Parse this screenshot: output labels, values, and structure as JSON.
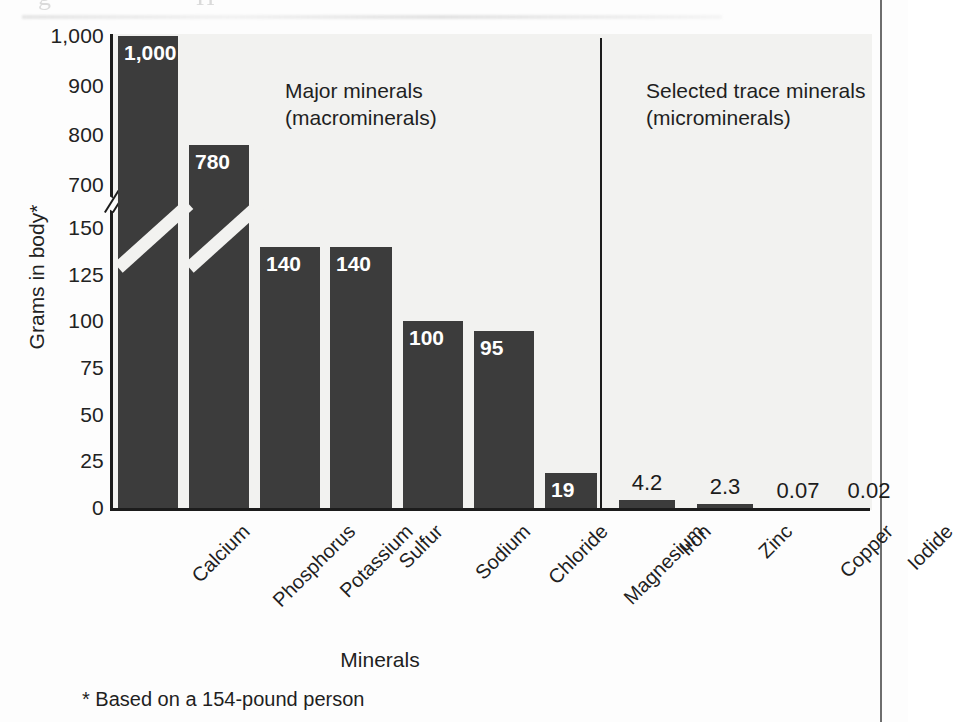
{
  "page": {
    "background_color": "#fdfdfd",
    "plot_background_color": "#f2f2f0",
    "bar_color": "#3c3c3c",
    "axis_color": "#1c1c1c",
    "scan_artifact_top_left": "g",
    "scan_artifact_top_right": "H"
  },
  "chart_data": {
    "type": "bar",
    "title": "",
    "xlabel": "Minerals",
    "ylabel": "Grams in body*",
    "categories": [
      "Calcium",
      "Phosphorus",
      "Potassium",
      "Sulfur",
      "Sodium",
      "Chloride",
      "Magnesium",
      "Iron",
      "Zinc",
      "Copper",
      "Iodide"
    ],
    "values": [
      1000,
      780,
      140,
      140,
      100,
      95,
      19,
      4.2,
      2.3,
      0.07,
      0.02
    ],
    "value_labels": [
      "1,000",
      "780",
      "140",
      "140",
      "100",
      "95",
      "19",
      "4.2",
      "2.3",
      "0.07",
      "0.02"
    ],
    "ytick_labels": [
      "1,000",
      "900",
      "800",
      "700",
      "150",
      "125",
      "100",
      "75",
      "50",
      "25",
      "0"
    ],
    "ytick_values": [
      1000,
      900,
      800,
      700,
      150,
      125,
      100,
      75,
      50,
      25,
      0
    ],
    "axis_broken": true,
    "axis_break_between": [
      150,
      700
    ],
    "grid": false,
    "legend": "none",
    "annotations": [
      {
        "id": "major",
        "text": "Major minerals\n(macrominerals)"
      },
      {
        "id": "trace",
        "text": "Selected trace minerals\n(microminerals)"
      }
    ],
    "divider_after_category": "Magnesium",
    "footnote": "* Based on a 154-pound person"
  },
  "axis": {
    "y_title": "Grams in body*",
    "x_title": "Minerals"
  },
  "notes": {
    "major": "Major minerals\n(macrominerals)",
    "trace": "Selected trace minerals\n(microminerals)"
  },
  "footnote": "* Based on a 154-pound person"
}
